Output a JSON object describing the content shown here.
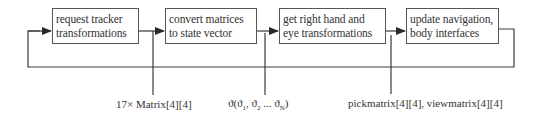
{
  "diagram": {
    "type": "flow",
    "boxes": [
      {
        "id": "request-tracker",
        "line1": "request tracker",
        "line2": "transformations"
      },
      {
        "id": "convert-matrices",
        "line1": "convert matrices",
        "line2": "to state vector"
      },
      {
        "id": "get-right-hand",
        "line1": "get right hand and",
        "line2": "eye transformations"
      },
      {
        "id": "update-navigation",
        "line1": "update navigation,",
        "line2": "body interfaces"
      }
    ],
    "signals": {
      "matrices": "17× Matrix[4][4]",
      "state_vector_prefix": "ϑ(ϑ",
      "state_vector_sub1": "1",
      "state_vector_mid1": ", ϑ",
      "state_vector_sub2": "2",
      "state_vector_mid2": " ... ϑ",
      "state_vector_subN": "N",
      "state_vector_suffix": ")",
      "pick_view": "pickmatrix[4][4], viewmatrix[4][4]"
    },
    "colors": {
      "line": "#3a3a3a",
      "box_border": "#555555",
      "text": "#333333"
    }
  }
}
